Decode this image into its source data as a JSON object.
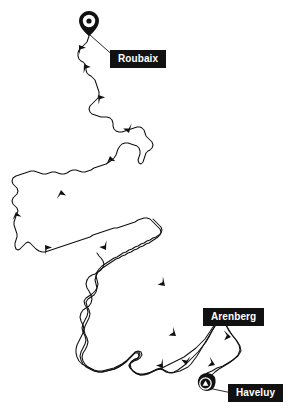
{
  "map": {
    "title": "Paris-Roubaix route map",
    "background_color": "#ffffff",
    "route_color": "#111111",
    "label_background": "#111111",
    "label_text_color": "#ffffff",
    "width": 297,
    "height": 419
  },
  "labels": [
    {
      "id": "roubaix",
      "text": "Roubaix",
      "x": 110,
      "y": 50,
      "role": "finish-location"
    },
    {
      "id": "arenberg",
      "text": "Arenberg",
      "x": 203,
      "y": 308,
      "role": "sector-location"
    },
    {
      "id": "haveluy",
      "text": "Haveluy",
      "x": 228,
      "y": 384,
      "role": "start-location"
    }
  ],
  "markers": [
    {
      "id": "roubaix-pin",
      "icon": "map-pin-icon",
      "x": 89,
      "y": 27,
      "label": "Roubaix"
    },
    {
      "id": "haveluy-pin",
      "icon": "map-pin-triangle-icon",
      "x": 205,
      "y": 387,
      "label": "Haveluy"
    }
  ],
  "direction_arrows": [
    {
      "x": 79,
      "y": 46,
      "angle": -60
    },
    {
      "x": 85,
      "y": 67,
      "angle": -70
    },
    {
      "x": 100,
      "y": 97,
      "angle": -60
    },
    {
      "x": 126,
      "y": 138,
      "angle": 110
    },
    {
      "x": 108,
      "y": 158,
      "angle": -75
    },
    {
      "x": 60,
      "y": 192,
      "angle": -85
    },
    {
      "x": 18,
      "y": 215,
      "angle": -100
    },
    {
      "x": 44,
      "y": 248,
      "angle": 120
    },
    {
      "x": 106,
      "y": 252,
      "angle": -70
    },
    {
      "x": 164,
      "y": 288,
      "angle": -60
    },
    {
      "x": 176,
      "y": 338,
      "angle": -65
    },
    {
      "x": 163,
      "y": 369,
      "angle": 100
    },
    {
      "x": 213,
      "y": 366,
      "angle": 30
    },
    {
      "x": 239,
      "y": 353,
      "angle": 215
    },
    {
      "x": 228,
      "y": 332,
      "angle": 215
    }
  ]
}
